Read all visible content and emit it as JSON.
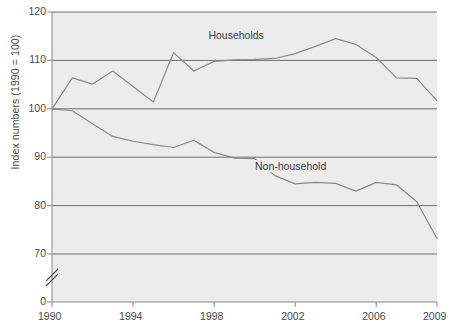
{
  "chart_data": {
    "type": "line",
    "title": "",
    "xlabel": "",
    "ylabel": "Index numbers (1990 = 100)",
    "xlim": [
      1990,
      2009
    ],
    "ylim": [
      70,
      120
    ],
    "y_axis_break": true,
    "y_break_between": [
      0,
      70
    ],
    "grid": true,
    "grid_axis": "y",
    "legend_position": "inline-annotation",
    "yticks": [
      0,
      70,
      80,
      90,
      100,
      110,
      120
    ],
    "ytick_labels": [
      "0",
      "70",
      "80",
      "90",
      "100",
      "110",
      "120"
    ],
    "xticks": [
      1990,
      1994,
      1998,
      2002,
      2006,
      2009
    ],
    "xtick_labels": [
      "1990",
      "1994",
      "1998",
      "2002",
      "2006",
      "2009"
    ],
    "x": [
      1990,
      1991,
      1992,
      1993,
      1994,
      1995,
      1996,
      1997,
      1998,
      1999,
      2000,
      2001,
      2002,
      2003,
      2004,
      2005,
      2006,
      2007,
      2008,
      2009
    ],
    "series": [
      {
        "name": "Households",
        "color": "#8a8a8a",
        "values": [
          100.0,
          106.4,
          105.1,
          107.8,
          104.6,
          101.4,
          111.6,
          107.8,
          109.8,
          110.1,
          110.2,
          110.4,
          111.4,
          112.9,
          114.5,
          113.3,
          110.6,
          106.4,
          106.3,
          101.7
        ]
      },
      {
        "name": "Non-household",
        "color": "#8a8a8a",
        "values": [
          100.0,
          99.6,
          96.9,
          94.3,
          93.3,
          92.6,
          92.0,
          93.5,
          91.0,
          89.8,
          89.7,
          86.2,
          84.5,
          84.8,
          84.6,
          83.0,
          84.8,
          84.3,
          80.8,
          73.2
        ]
      }
    ],
    "annotations": [
      {
        "name": "households-label",
        "text": "Households",
        "x": 1999.2,
        "y": 115.0
      },
      {
        "name": "non-household-label",
        "text": "Non-household",
        "x": 2001.5,
        "y": 88.0
      }
    ],
    "axis_colors": {
      "plot_background": "#ececec",
      "gridline": "#6e6e6e",
      "axis": "#8a8a8a",
      "text": "#4a4a4a",
      "line": "#8a8a8a"
    }
  }
}
